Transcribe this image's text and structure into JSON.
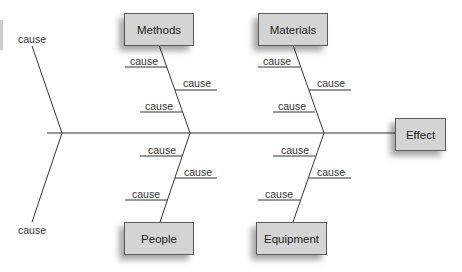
{
  "diagram": {
    "type": "fishbone",
    "effect": "Effect",
    "categories": [
      {
        "name": "Methods",
        "causes": [
          "cause",
          "cause",
          "cause"
        ]
      },
      {
        "name": "Materials",
        "causes": [
          "cause",
          "cause",
          "cause"
        ]
      },
      {
        "name": "People",
        "causes": [
          "cause",
          "cause",
          "cause"
        ]
      },
      {
        "name": "Equipment",
        "causes": [
          "cause",
          "cause",
          "cause"
        ]
      }
    ],
    "tail_causes": [
      "cause",
      "cause"
    ],
    "colors": {
      "box_fill": "#d4d4d4",
      "box_border": "#5a5a5a",
      "line": "#333333"
    }
  }
}
